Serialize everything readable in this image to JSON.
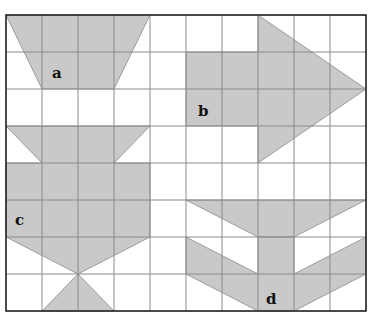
{
  "diagram": {
    "grid": {
      "cols": 10,
      "rows": 8,
      "x0": 6,
      "y0": 15,
      "cell_w": 36,
      "cell_h": 37
    },
    "colors": {
      "fill": "#c9c9c9",
      "grid": "#8a8a8a",
      "border": "#222222",
      "background": "#ffffff"
    },
    "shapes": [
      {
        "label": "a",
        "points": "6,15 150,15 114,89 42,89",
        "label_x": 52,
        "label_y": 78
      },
      {
        "label": "b",
        "points": "186,52 258,52 258,15 366,89 258,163 258,126 186,126",
        "label_x": 198,
        "label_y": 116
      },
      {
        "label": "c",
        "points": "6,126 150,126 114,163 150,163 150,237 78,274 6,237 6,163 42,163",
        "label_x": 15,
        "label_y": 225
      },
      {
        "label": "c2",
        "points": "78,274 114,311 42,311"
      },
      {
        "label": "d",
        "points": "186,200 366,200 294,237 258,237",
        "label_x": 266,
        "label_y": 304
      },
      {
        "label": "d2",
        "points": "186,237 258,274 258,237 294,237 294,274 366,237 366,274 294,311 258,311 186,274"
      }
    ],
    "labels": [
      "a",
      "b",
      "c",
      "d"
    ]
  }
}
